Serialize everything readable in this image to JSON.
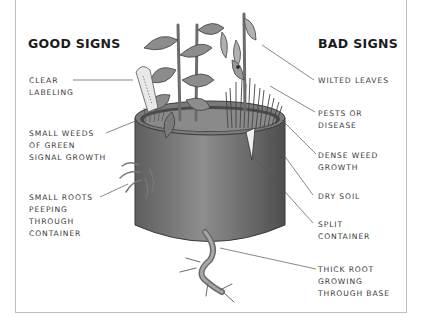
{
  "diagram": {
    "good_signs": {
      "heading": "GOOD SIGNS",
      "items": [
        "CLEAR\nLABELING",
        "SMALL WEEDS\nOF GREEN\nSIGNAL GROWTH",
        "SMALL ROOTS\nPEEPING\nTHROUGH\nCONTAINER"
      ]
    },
    "bad_signs": {
      "heading": "BAD SIGNS",
      "items": [
        "WILTED LEAVES",
        "PESTS OR\nDISEASE",
        "DENSE WEED\nGROWTH",
        "DRY SOIL",
        "SPLIT\nCONTAINER",
        "THICK ROOT\nGROWING\nTHROUGH BASE"
      ]
    },
    "colors": {
      "pot": "#6e6e6e",
      "pot_light": "#9a9a9a",
      "leaf": "#8c8c8c",
      "leaf_dark": "#5a5a5a",
      "leader_line": "#555555",
      "frame": "#bdbdbd"
    }
  }
}
